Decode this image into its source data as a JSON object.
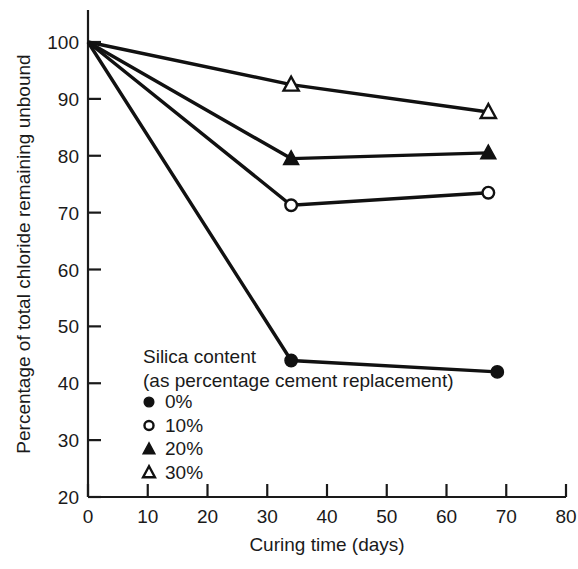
{
  "chart_data": {
    "type": "line",
    "title": "",
    "xlabel": "Curing time (days)",
    "ylabel": "Percentage of total chloride remaining unbound",
    "xlim": [
      0,
      80
    ],
    "ylim": [
      20,
      100
    ],
    "xticks": [
      0,
      10,
      20,
      30,
      40,
      50,
      60,
      70,
      80
    ],
    "yticks": [
      20,
      30,
      40,
      50,
      60,
      70,
      80,
      90,
      100
    ],
    "xtick_labels": [
      "0",
      "10",
      "20",
      "30",
      "40",
      "50",
      "60",
      "70",
      "80"
    ],
    "ytick_labels": [
      "20",
      "30",
      "40",
      "50",
      "60",
      "70",
      "80",
      "90",
      "100"
    ],
    "grid": false,
    "legend_position": "inside-lower-left",
    "legend_title_line1": "Silica content",
    "legend_title_line2": "(as percentage cement replacement)",
    "series": [
      {
        "name": "0%",
        "marker": "filled-circle",
        "x": [
          0,
          34,
          68.5
        ],
        "values": [
          100,
          44,
          42
        ]
      },
      {
        "name": "10%",
        "marker": "open-circle",
        "x": [
          0,
          34,
          67
        ],
        "values": [
          100,
          71.3,
          73.5
        ]
      },
      {
        "name": "20%",
        "marker": "filled-triangle",
        "x": [
          0,
          34,
          67
        ],
        "values": [
          100,
          79.5,
          80.5
        ]
      },
      {
        "name": "30%",
        "marker": "open-triangle",
        "x": [
          0,
          34,
          67
        ],
        "values": [
          100,
          92.5,
          87.7
        ]
      }
    ]
  },
  "legend": {
    "title_line1": "Silica content",
    "title_line2": "(as percentage cement replacement)",
    "entries": [
      {
        "label": "0%",
        "marker": "filled-circle"
      },
      {
        "label": "10%",
        "marker": "open-circle"
      },
      {
        "label": "20%",
        "marker": "filled-triangle"
      },
      {
        "label": "30%",
        "marker": "open-triangle"
      }
    ]
  },
  "axes": {
    "x_title": "Curing time (days)",
    "y_title": "Percentage of total chloride remaining unbound",
    "x_ticks": [
      "0",
      "10",
      "20",
      "30",
      "40",
      "50",
      "60",
      "70",
      "80"
    ],
    "y_ticks": [
      "100",
      "90",
      "80",
      "70",
      "60",
      "50",
      "40",
      "30",
      "20"
    ]
  },
  "colors": {
    "ink": "#111111",
    "background": "#ffffff"
  }
}
